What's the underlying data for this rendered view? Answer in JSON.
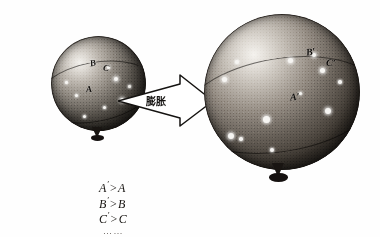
{
  "figure": {
    "background_color": "#fefefe"
  },
  "arrow": {
    "label": "膨胀",
    "name": "expansion-arrow",
    "direction": "left-to-right",
    "color": "#141210"
  },
  "small_balloon": {
    "name": "small-balloon",
    "caption": "before expansion",
    "labels": [
      {
        "text": "B",
        "name": "point-label-b"
      },
      {
        "text": "C",
        "name": "point-label-c"
      },
      {
        "text": "A",
        "name": "point-label-a"
      }
    ]
  },
  "large_balloon": {
    "name": "large-balloon",
    "caption": "after expansion",
    "labels": [
      {
        "text": "B′",
        "name": "point-label-b-prime"
      },
      {
        "text": "C′",
        "name": "point-label-c-prime"
      },
      {
        "text": "A′",
        "name": "point-label-a-prime"
      }
    ]
  },
  "formulas": {
    "name": "inequality-list",
    "rows": [
      {
        "left": "A",
        "prime": "′",
        "op": ">",
        "right": "A"
      },
      {
        "left": "B",
        "prime": "′",
        "op": ">",
        "right": "B"
      },
      {
        "left": "C",
        "prime": "′",
        "op": ">",
        "right": "C"
      }
    ],
    "ellipsis": "……"
  }
}
